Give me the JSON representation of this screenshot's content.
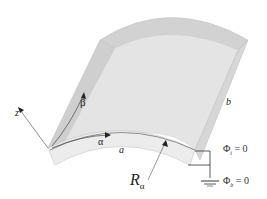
{
  "diagram": {
    "type": "curved shell panel schematic",
    "labels": {
      "z_axis": "z",
      "beta": "β",
      "alpha": "α",
      "a": "a",
      "b": "b",
      "radius": "R",
      "radius_sub": "α",
      "phi_top": "Φ",
      "phi_top_sub": "t",
      "phi_top_eq": " = 0",
      "phi_bottom": "Φ",
      "phi_bottom_sub": "b",
      "phi_bottom_eq": " = 0"
    },
    "colors": {
      "panel_top": "#d9d9d9",
      "panel_face": "#e6e6e6",
      "panel_edge": "#c8c8c8",
      "lines": "#333333"
    }
  }
}
